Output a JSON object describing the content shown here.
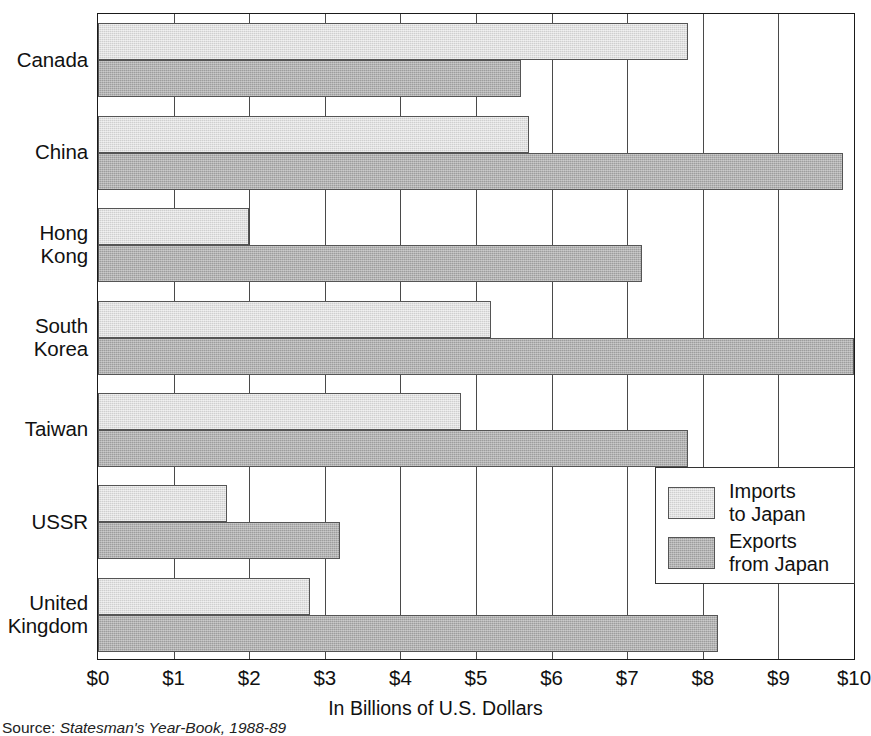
{
  "chart_data": {
    "type": "bar",
    "orientation": "horizontal",
    "title": "",
    "xlabel": "In Billions of U.S. Dollars",
    "ylabel": "",
    "xlim": [
      0,
      10
    ],
    "xticks": [
      "$0",
      "$1",
      "$2",
      "$3",
      "$4",
      "$5",
      "$6",
      "$7",
      "$8",
      "$9",
      "$10"
    ],
    "xtick_values": [
      0,
      1,
      2,
      3,
      4,
      5,
      6,
      7,
      8,
      9,
      10
    ],
    "grid": true,
    "grid_axis": "x",
    "legend_position": "inside-bottom-right",
    "categories": [
      "Canada",
      "China",
      "Hong Kong",
      "South Korea",
      "Taiwan",
      "USSR",
      "United Kingdom"
    ],
    "series": [
      {
        "name": "Imports to Japan",
        "color": "#cfcfcf",
        "values": [
          7.8,
          5.7,
          2.0,
          5.2,
          4.8,
          1.7,
          2.8
        ]
      },
      {
        "name": "Exports from Japan",
        "color": "#9d9d9d",
        "values": [
          5.6,
          9.85,
          7.2,
          10.0,
          7.8,
          3.2,
          8.2
        ]
      }
    ],
    "source": "Source: Statesman's Year-Book, 1988-89"
  },
  "axis": {
    "x_title": "In Billions of U.S. Dollars",
    "ticks": [
      {
        "label": "$0",
        "value": 0
      },
      {
        "label": "$1",
        "value": 1
      },
      {
        "label": "$2",
        "value": 2
      },
      {
        "label": "$3",
        "value": 3
      },
      {
        "label": "$4",
        "value": 4
      },
      {
        "label": "$5",
        "value": 5
      },
      {
        "label": "$6",
        "value": 6
      },
      {
        "label": "$7",
        "value": 7
      },
      {
        "label": "$8",
        "value": 8
      },
      {
        "label": "$9",
        "value": 9
      },
      {
        "label": "$10",
        "value": 10
      }
    ]
  },
  "categories": [
    {
      "label": "Canada"
    },
    {
      "label": "China"
    },
    {
      "label": "Hong\nKong"
    },
    {
      "label": "South\nKorea"
    },
    {
      "label": "Taiwan"
    },
    {
      "label": "USSR"
    },
    {
      "label": "United\nKingdom"
    }
  ],
  "legend": {
    "entries": [
      {
        "label": "Imports\nto Japan",
        "key": "imports"
      },
      {
        "label": "Exports\nfrom Japan",
        "key": "exports"
      }
    ]
  },
  "source_note": {
    "prefix": "Source: ",
    "title": "Statesman's Year-Book, 1988-89"
  },
  "colors": {
    "imports": "#cfcfcf",
    "exports": "#9d9d9d",
    "frame": "#1a1a1a",
    "grid": "#4a4a4a"
  }
}
